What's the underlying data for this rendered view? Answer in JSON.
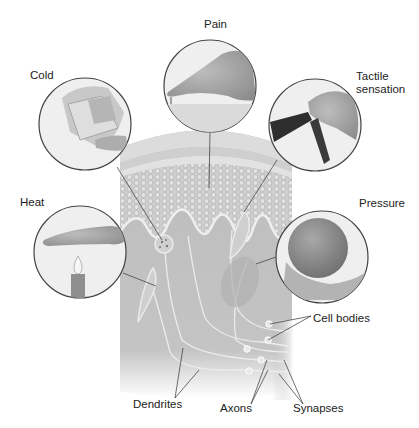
{
  "diagram": {
    "style": "grayscale illustration",
    "colors": {
      "background": "#ffffff",
      "skin_block": "#bdbdbd",
      "epidermis": "#d6d6d6",
      "circle_fill": "#eeeeee",
      "circle_stroke": "#444444",
      "text": "#222222"
    },
    "stimuli": [
      {
        "id": "pain",
        "label": "Pain",
        "depiction": "finger pressing a pin"
      },
      {
        "id": "cold",
        "label": "Cold",
        "depiction": "hand holding ice cube"
      },
      {
        "id": "tactile",
        "label": "Tactile sensation",
        "depiction": "tweezers / tongs held by fingers"
      },
      {
        "id": "heat",
        "label": "Heat",
        "depiction": "hand over candle flame"
      },
      {
        "id": "pressure",
        "label": "Pressure",
        "depiction": "hand holding a ball"
      }
    ],
    "structures": [
      {
        "id": "cell-bodies",
        "label": "Cell bodies"
      },
      {
        "id": "dendrites",
        "label": "Dendrites"
      },
      {
        "id": "axons",
        "label": "Axons"
      },
      {
        "id": "synapses",
        "label": "Synapses"
      }
    ]
  },
  "labels": {
    "pain": "Pain",
    "cold": "Cold",
    "tactile": "Tactile sensation",
    "heat": "Heat",
    "pressure": "Pressure",
    "cell_bodies": "Cell bodies",
    "dendrites": "Dendrites",
    "axons": "Axons",
    "synapses": "Synapses"
  }
}
